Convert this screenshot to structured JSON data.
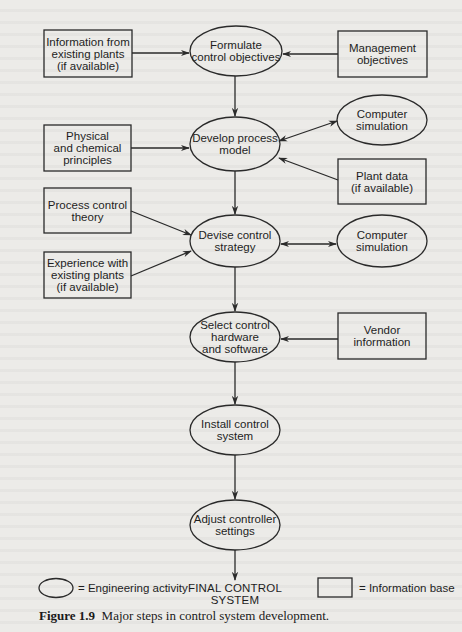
{
  "activities": [
    {
      "id": "formulate",
      "label": "Formulate\ncontrol objectives",
      "cx": 236,
      "cy": 51,
      "rx": 46,
      "ry": 25
    },
    {
      "id": "develop",
      "label": "Develop process\nmodel",
      "cx": 235,
      "cy": 144,
      "rx": 45,
      "ry": 27
    },
    {
      "id": "devise",
      "label": "Devise control\nstrategy",
      "cx": 235,
      "cy": 241,
      "rx": 45,
      "ry": 26
    },
    {
      "id": "select",
      "label": "Select control\nhardware\nand software",
      "cx": 235,
      "cy": 337,
      "rx": 45,
      "ry": 25
    },
    {
      "id": "install",
      "label": "Install control\nsystem",
      "cx": 235,
      "cy": 430,
      "rx": 45,
      "ry": 25
    },
    {
      "id": "adjust",
      "label": "Adjust controller\nsettings",
      "cx": 235,
      "cy": 525,
      "rx": 45,
      "ry": 25
    },
    {
      "id": "sim1",
      "label": "Computer\nsimulation",
      "cx": 382,
      "cy": 120,
      "rx": 45,
      "ry": 25
    },
    {
      "id": "sim2",
      "label": "Computer\nsimulation",
      "cx": 382,
      "cy": 241,
      "rx": 45,
      "ry": 26
    }
  ],
  "info_bases": [
    {
      "id": "existing_info",
      "label": "Information from\nexisting plants\n(if available)",
      "x": 44,
      "y": 30,
      "w": 88,
      "h": 47
    },
    {
      "id": "management",
      "label": "Management\nobjectives",
      "x": 338,
      "y": 31,
      "w": 89,
      "h": 46
    },
    {
      "id": "physical",
      "label": "Physical\nand chemical\nprinciples",
      "x": 44,
      "y": 125,
      "w": 87,
      "h": 46
    },
    {
      "id": "plant_data",
      "label": "Plant data\n(if available)",
      "x": 338,
      "y": 159,
      "w": 88,
      "h": 45
    },
    {
      "id": "pc_theory",
      "label": "Process control\ntheory",
      "x": 44,
      "y": 188,
      "w": 87,
      "h": 45
    },
    {
      "id": "experience",
      "label": "Experience with\nexisting plants\n(if available)",
      "x": 44,
      "y": 252,
      "w": 87,
      "h": 46
    },
    {
      "id": "vendor",
      "label": "Vendor\ninformation",
      "x": 338,
      "y": 313,
      "w": 88,
      "h": 46
    }
  ],
  "final": {
    "label": "FINAL CONTROL\nSYSTEM"
  },
  "legend": {
    "activity_label": "= Engineering activity",
    "info_label": "= Information base"
  },
  "caption": {
    "figure_number": "Figure 1.9",
    "text": "Major steps in control system development."
  },
  "colors": {
    "background": "#ecebe8",
    "stroke": "#2a2a2a",
    "text": "#1e1e1e"
  }
}
